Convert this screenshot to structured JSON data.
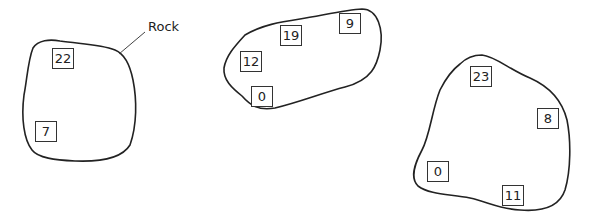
{
  "label": {
    "text": "Rock"
  },
  "rocks": [
    {
      "id": "rock-1",
      "values": [
        "22",
        "7"
      ]
    },
    {
      "id": "rock-2",
      "values": [
        "9",
        "19",
        "12",
        "0"
      ]
    },
    {
      "id": "rock-3",
      "values": [
        "23",
        "8",
        "0",
        "11"
      ]
    }
  ],
  "colors": {
    "outline": "#222222",
    "box_border": "#333333",
    "text": "#222222",
    "background": "#ffffff"
  }
}
